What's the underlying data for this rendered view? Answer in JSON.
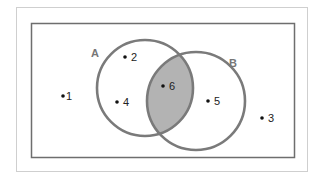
{
  "diagram": {
    "type": "venn",
    "colors": {
      "outer_frame": "#cfcfcf",
      "universe_border": "#6e6e6e",
      "circle_stroke": "#7a7a7a",
      "intersection_fill": "#b3b3b3",
      "point": "#111111"
    },
    "sets": [
      {
        "label": "A",
        "cx": 145,
        "cy": 88,
        "r": 48,
        "label_x": 91,
        "label_y": 57
      },
      {
        "label": "B",
        "cx": 196,
        "cy": 101,
        "r": 49,
        "label_x": 229,
        "label_y": 67
      }
    ],
    "intersection": {
      "label": "A ∩ B",
      "shaded": true
    },
    "points": [
      {
        "label": "1",
        "x": 63,
        "y": 96,
        "region": "outside"
      },
      {
        "label": "2",
        "x": 125,
        "y": 57,
        "region": "A only"
      },
      {
        "label": "3",
        "x": 262,
        "y": 118,
        "region": "outside"
      },
      {
        "label": "4",
        "x": 117,
        "y": 102,
        "region": "A only"
      },
      {
        "label": "5",
        "x": 208,
        "y": 101,
        "region": "B only"
      },
      {
        "label": "6",
        "x": 163,
        "y": 86,
        "region": "A and B"
      }
    ]
  }
}
